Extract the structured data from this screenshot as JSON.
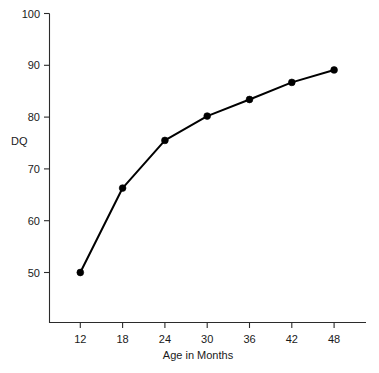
{
  "chart_data": {
    "type": "line",
    "title": "",
    "subtitle": "",
    "xlabel": "Age in Months",
    "ylabel": "DQ",
    "x": [
      12,
      18,
      24,
      30,
      36,
      42,
      48
    ],
    "xticklabels": [
      "12",
      "18",
      "24",
      "30",
      "36",
      "42",
      "48"
    ],
    "yticks": [
      50,
      60,
      70,
      80,
      90,
      100
    ],
    "yticklabels": [
      "50",
      "60",
      "70",
      "80",
      "90",
      "100"
    ],
    "xlim": [
      9,
      53
    ],
    "ylim": [
      40,
      100
    ],
    "grid": false,
    "legend": false,
    "legend_position": "none",
    "marker": "filled-circle",
    "line_color": "#000000",
    "marker_color": "#000000",
    "background_color": "#ffffff",
    "axis_color": "#2b2b2b",
    "series": [
      {
        "name": "DQ",
        "values": [
          50.0,
          66.3,
          75.5,
          80.2,
          83.4,
          86.7,
          89.1
        ]
      }
    ]
  },
  "axes": {
    "y_label_text": "DQ",
    "x_label_text": "Age in Months"
  }
}
